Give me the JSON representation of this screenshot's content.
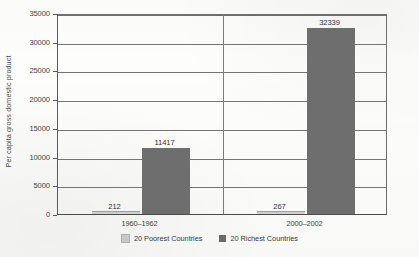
{
  "chart_data": {
    "type": "bar",
    "title": "",
    "xlabel": "",
    "ylabel": "Per capita gross domestic product",
    "ylim": [
      0,
      35000
    ],
    "yticks": [
      0,
      5000,
      10000,
      15000,
      20000,
      25000,
      30000,
      35000
    ],
    "ytick_labels": [
      "0",
      "5000",
      "10000",
      "15000",
      "20000",
      "25000",
      "30000",
      "35000"
    ],
    "categories": [
      "1960–1962",
      "2000–2002"
    ],
    "grid": true,
    "legend_position": "bottom",
    "series": [
      {
        "name": "20 Poorest Countries",
        "color": "#cfcfcf",
        "values": [
          212,
          267
        ],
        "value_labels": [
          "212",
          "267"
        ]
      },
      {
        "name": "20 Richest Countries",
        "color": "#6e6e6e",
        "values": [
          11417,
          32339
        ],
        "value_labels": [
          "11417",
          "32339"
        ]
      }
    ]
  },
  "axis": {
    "y_title": "Per capita gross domestic product"
  },
  "legend": {
    "items": [
      {
        "label": "20 Poorest Countries",
        "swatch": "legend-swatch-poorest"
      },
      {
        "label": "20 Richest Countries",
        "swatch": "legend-swatch-richest"
      }
    ]
  }
}
